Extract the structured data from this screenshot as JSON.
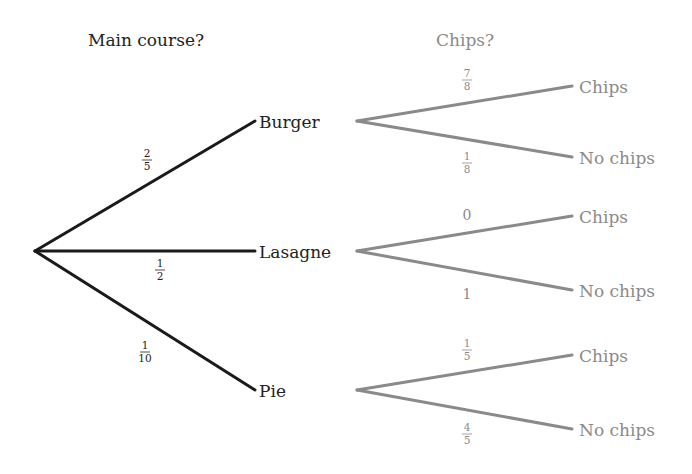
{
  "diagram": {
    "type": "probability-tree",
    "colors": {
      "stage1": "#1a1a1a",
      "stage2": "#8a8a8a",
      "stage1_text": "#222222",
      "stage2_text": "#8a8a8a"
    },
    "headings": {
      "stage1": "Main course?",
      "stage2": "Chips?"
    },
    "root": {
      "x": 35,
      "y": 251
    },
    "stage1": [
      {
        "label": "Burger",
        "prob_num": "2",
        "prob_den": "5",
        "end": {
          "x": 255,
          "y": 121
        },
        "label_pos": {
          "x": 259,
          "y": 128
        },
        "prob_pos": {
          "x": 147,
          "y": 160
        }
      },
      {
        "label": "Lasagne",
        "prob_num": "1",
        "prob_den": "2",
        "end": {
          "x": 255,
          "y": 251
        },
        "label_pos": {
          "x": 259,
          "y": 258
        },
        "prob_pos": {
          "x": 160,
          "y": 270
        }
      },
      {
        "label": "Pie",
        "prob_num": "1",
        "prob_den": "10",
        "end": {
          "x": 255,
          "y": 390
        },
        "label_pos": {
          "x": 259,
          "y": 397
        },
        "prob_pos": {
          "x": 145,
          "y": 352
        }
      }
    ],
    "stage2": [
      {
        "parent": "Burger",
        "origin": {
          "x": 357,
          "y": 121
        },
        "branches": [
          {
            "label": "Chips",
            "prob_num": "7",
            "prob_den": "8",
            "prob_whole": null,
            "end": {
              "x": 572,
              "y": 86
            },
            "label_pos": {
              "x": 579,
              "y": 93
            },
            "prob_pos": {
              "x": 467,
              "y": 80
            }
          },
          {
            "label": "No chips",
            "prob_num": "1",
            "prob_den": "8",
            "prob_whole": null,
            "end": {
              "x": 572,
              "y": 157
            },
            "label_pos": {
              "x": 579,
              "y": 164
            },
            "prob_pos": {
              "x": 467,
              "y": 163
            }
          }
        ]
      },
      {
        "parent": "Lasagne",
        "origin": {
          "x": 357,
          "y": 251
        },
        "branches": [
          {
            "label": "Chips",
            "prob_num": null,
            "prob_den": null,
            "prob_whole": "0",
            "end": {
              "x": 572,
              "y": 216
            },
            "label_pos": {
              "x": 579,
              "y": 223
            },
            "prob_pos": {
              "x": 467,
              "y": 220
            }
          },
          {
            "label": "No chips",
            "prob_num": null,
            "prob_den": null,
            "prob_whole": "1",
            "end": {
              "x": 572,
              "y": 290
            },
            "label_pos": {
              "x": 579,
              "y": 297
            },
            "prob_pos": {
              "x": 467,
              "y": 299
            }
          }
        ]
      },
      {
        "parent": "Pie",
        "origin": {
          "x": 357,
          "y": 390
        },
        "branches": [
          {
            "label": "Chips",
            "prob_num": "1",
            "prob_den": "5",
            "prob_whole": null,
            "end": {
              "x": 572,
              "y": 355
            },
            "label_pos": {
              "x": 579,
              "y": 362
            },
            "prob_pos": {
              "x": 467,
              "y": 350
            }
          },
          {
            "label": "No chips",
            "prob_num": "4",
            "prob_den": "5",
            "prob_whole": null,
            "end": {
              "x": 572,
              "y": 429
            },
            "label_pos": {
              "x": 579,
              "y": 436
            },
            "prob_pos": {
              "x": 467,
              "y": 434
            }
          }
        ]
      }
    ]
  }
}
